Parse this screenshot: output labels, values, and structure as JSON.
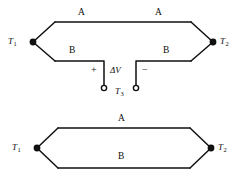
{
  "figure": {
    "ink_color": "#111111",
    "background_color": "#ffffff"
  },
  "top_circuit": {
    "name": "thermocouple-with-voltmeter-terminals",
    "wire_top_left_label": "A",
    "wire_top_right_label": "A",
    "wire_bottom_left_label": "B",
    "wire_bottom_right_label": "B",
    "junction_left": {
      "label": "T",
      "subscript": "1"
    },
    "junction_right": {
      "label": "T",
      "subscript": "2"
    },
    "terminal_block": {
      "plus_label": "+",
      "minus_label": "−",
      "voltage_label": "ΔV",
      "reference": {
        "label": "T",
        "subscript": "3"
      }
    }
  },
  "bottom_circuit": {
    "name": "thermocouple-loop",
    "wire_top_label": "A",
    "wire_bottom_label": "B",
    "junction_left": {
      "label": "T",
      "subscript": "1"
    },
    "junction_right": {
      "label": "T",
      "subscript": "2"
    }
  }
}
